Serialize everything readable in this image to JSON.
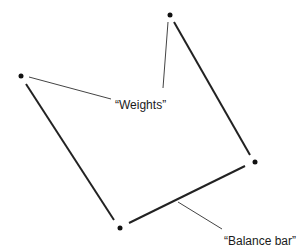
{
  "diagram": {
    "labels": {
      "weights": "“Weights”",
      "balance_bar": "“Balance bar”"
    },
    "colors": {
      "line": "#222222",
      "leader": "#444444",
      "dot": "#111111",
      "background": "#ffffff"
    },
    "points": [
      {
        "id": "left-weight",
        "x": 21,
        "y": 76
      },
      {
        "id": "top-weight",
        "x": 170,
        "y": 15
      },
      {
        "id": "right-weight",
        "x": 255,
        "y": 162
      },
      {
        "id": "bottom-weight",
        "x": 120,
        "y": 228
      }
    ]
  }
}
